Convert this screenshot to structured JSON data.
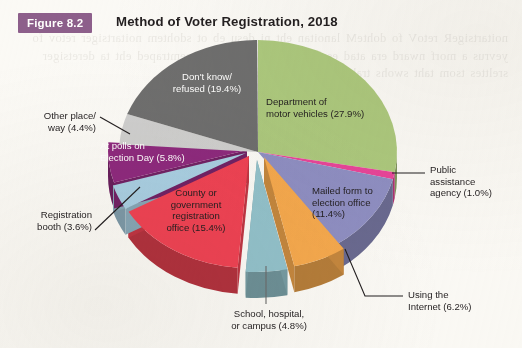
{
  "figure": {
    "badge": "Figure 8.2",
    "title": "Method of Voter Registration, 2018",
    "badge_color": "#8d5f8c",
    "title_color": "#231f20",
    "page_background": "#fbfaf7"
  },
  "bleed_text": "noitartsigeR retoV fo dohteM lanoitan eht ni desu eb ot sdohtem noitartsiger retov fo yevrus a morf nward era atad esehT .selcihev rotom fo tnemtraped eht ta deretsiger srelttes tsom taht swohs trahc ehT .yevrus noitcele tsop",
  "chart_data": {
    "type": "pie",
    "title": "Method of Voter Registration, 2018",
    "subtitle": "",
    "xlabel": "",
    "ylabel": "",
    "units": "percent",
    "total": 100.0,
    "start_angle_deg": 0,
    "direction": "clockwise",
    "style": "3d-pie-exploded",
    "legend_position": "labels-on-and-around-slices",
    "grid": false,
    "categories": [
      "Department of motor vehicles",
      "Public assistance agency",
      "Mailed form to election office",
      "Using the Internet",
      "School, hospital, or campus",
      "County or government registration office",
      "Registration booth",
      "At polls on Election Day",
      "Other place/way",
      "Don't know/refused"
    ],
    "values": [
      27.9,
      1.0,
      11.4,
      6.2,
      4.8,
      15.4,
      3.6,
      5.8,
      4.4,
      19.4
    ],
    "colors": [
      "#adc97e",
      "#e8469a",
      "#8f8fc4",
      "#f5a94e",
      "#93c2cc",
      "#ef4354",
      "#a9cfe3",
      "#8e2a7e",
      "#cfcfcf",
      "#6f6f6f"
    ],
    "slices": [
      {
        "label": "Department of motor vehicles",
        "value": 27.9,
        "display": "Department of\nmotor vehicles (27.9%)",
        "color": "#adc97e",
        "label_placement": "inside",
        "label_color": "#231f20"
      },
      {
        "label": "Public assistance agency",
        "value": 1.0,
        "display": "Public\nassistance\nagency (1.0%)",
        "color": "#e8469a",
        "label_placement": "outside-right",
        "label_color": "#231f20"
      },
      {
        "label": "Mailed form to election office",
        "value": 11.4,
        "display": "Mailed form to\nelection office\n(11.4%)",
        "color": "#8f8fc4",
        "label_placement": "inside",
        "label_color": "#231f20"
      },
      {
        "label": "Using the Internet",
        "value": 6.2,
        "display": "Using the\nInternet (6.2%)",
        "color": "#f5a94e",
        "label_placement": "outside-bottom-right",
        "label_color": "#231f20"
      },
      {
        "label": "School, hospital, or campus",
        "value": 4.8,
        "display": "School, hospital,\nor campus (4.8%)",
        "color": "#93c2cc",
        "label_placement": "outside-bottom",
        "label_color": "#231f20"
      },
      {
        "label": "County or government registration office",
        "value": 15.4,
        "display": "County or\ngovernment\nregistration\noffice (15.4%)",
        "color": "#ef4354",
        "label_placement": "inside",
        "label_color": "#231f20"
      },
      {
        "label": "Registration booth",
        "value": 3.6,
        "display": "Registration\nbooth (3.6%)",
        "color": "#a9cfe3",
        "label_placement": "outside-left",
        "label_color": "#231f20"
      },
      {
        "label": "At polls on Election Day",
        "value": 5.8,
        "display": "At polls on\nElection Day (5.8%)",
        "color": "#8e2a7e",
        "label_placement": "inside",
        "label_color": "#ffffff"
      },
      {
        "label": "Other place/way",
        "value": 4.4,
        "display": "Other place/\nway (4.4%)",
        "color": "#cfcfcf",
        "label_placement": "outside-left",
        "label_color": "#231f20"
      },
      {
        "label": "Don't know/refused",
        "value": 19.4,
        "display": "Don't know/\nrefused (19.4%)",
        "color": "#6f6f6f",
        "label_placement": "inside",
        "label_color": "#ffffff"
      }
    ]
  }
}
